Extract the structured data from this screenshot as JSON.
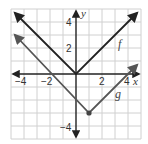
{
  "graph": {
    "origin_px": [
      76,
      74
    ],
    "unit_px": 13,
    "x_range": [
      -5,
      5
    ],
    "y_range": [
      -5,
      5
    ],
    "grid": true,
    "axes": {
      "x_label": "x",
      "y_label": "y",
      "x_ticks": [
        {
          "value": -4,
          "label": "−4"
        },
        {
          "value": -2,
          "label": "−2"
        },
        {
          "value": 2,
          "label": "2"
        },
        {
          "value": 4,
          "label": "4"
        }
      ],
      "y_ticks": [
        {
          "value": 4,
          "label": "4"
        },
        {
          "value": 2,
          "label": "2"
        },
        {
          "value": -4,
          "label": "−4"
        }
      ]
    },
    "functions": [
      {
        "name": "f",
        "label": "f",
        "type": "absolute-value",
        "vertex": [
          0,
          0
        ],
        "color": "#222222"
      },
      {
        "name": "g",
        "label": "g",
        "type": "absolute-value",
        "vertex": [
          1,
          -3
        ],
        "color": "#555555",
        "vertex_marked": true
      }
    ],
    "colors": {
      "grid": "#d0d0d0",
      "axis": "#222222",
      "f_line": "#222222",
      "g_line": "#555555"
    }
  }
}
